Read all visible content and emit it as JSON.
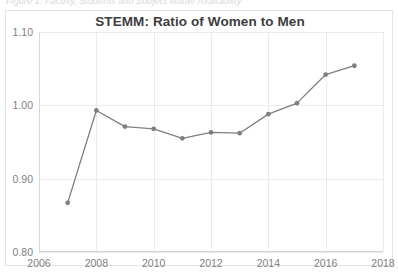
{
  "document": {
    "caption_clipped": "Figure 1. Faculty, Students and Subject Matter Availability"
  },
  "chart": {
    "title": "STEMM: Ratio of Women to Men",
    "series_color": "#7f7f7f",
    "grid_color": "#eceaea",
    "axis_color": "#d4d4d4",
    "label_color": "#7f7f7f",
    "title_color": "#3d3d3d",
    "plot_background": "#ffffff",
    "frame_border_color": "#e3e3e3"
  },
  "chart_data": {
    "type": "line",
    "title": "STEMM: Ratio of Women to Men",
    "xlabel": "",
    "ylabel": "",
    "x": [
      2007,
      2008,
      2009,
      2010,
      2011,
      2012,
      2013,
      2014,
      2015,
      2016,
      2017
    ],
    "values": [
      0.867,
      0.993,
      0.971,
      0.968,
      0.955,
      0.963,
      0.962,
      0.988,
      1.003,
      1.042,
      1.054
    ],
    "series": [
      {
        "name": "STEMM ratio of women to men",
        "values": [
          0.867,
          0.993,
          0.971,
          0.968,
          0.955,
          0.963,
          0.962,
          0.988,
          1.003,
          1.042,
          1.054
        ]
      }
    ],
    "xlim": [
      2006,
      2018
    ],
    "ylim": [
      0.8,
      1.1
    ],
    "xticks": [
      2006,
      2008,
      2010,
      2012,
      2014,
      2016,
      2018
    ],
    "xtick_labels": [
      "2006",
      "2008",
      "2010",
      "2012",
      "2014",
      "2016",
      "2018"
    ],
    "yticks": [
      0.8,
      0.9,
      1.0,
      1.1
    ],
    "ytick_labels": [
      "0.80",
      "0.90",
      "1.00",
      "1.10"
    ],
    "grid": true,
    "grid_axis": "both",
    "legend": false,
    "markers": true,
    "marker_shape": "circle"
  }
}
